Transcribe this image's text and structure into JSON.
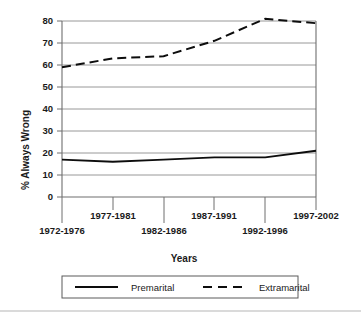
{
  "chart_data": {
    "type": "line",
    "title": "",
    "xlabel": "Years",
    "ylabel": "% Always Wrong",
    "categories": [
      "1972-1976",
      "1977-1981",
      "1982-1986",
      "1987-1991",
      "1992-1996",
      "1997-2002"
    ],
    "series": [
      {
        "name": "Premarital",
        "style": "solid",
        "values": [
          17,
          16,
          17,
          18,
          18,
          21
        ]
      },
      {
        "name": "Extramarital",
        "style": "dashed",
        "values": [
          59,
          63,
          64,
          71,
          81,
          79
        ]
      }
    ],
    "ylim": [
      0,
      80
    ],
    "ytick_labels": [
      "0",
      "10",
      "20",
      "30",
      "40",
      "50",
      "60",
      "70",
      "80"
    ],
    "ytick_values": [
      0,
      10,
      20,
      30,
      40,
      50,
      60,
      70,
      80
    ],
    "grid": true,
    "grid_axis": "y",
    "legend_position": "bottom",
    "legend_entries": [
      "Premarital",
      "Extramarital"
    ],
    "line_color": "#0d0d0d",
    "grid_color": "#8c8c8c",
    "background": "#ffffff"
  },
  "axes": {
    "y_title": "% Always Wrong",
    "x_title": "Years"
  },
  "ticks": {
    "y": [
      "80",
      "70",
      "60",
      "50",
      "40",
      "30",
      "20",
      "10",
      "0"
    ],
    "x_row_top": [
      "1977-1981",
      "1987-1991",
      "1997-2002"
    ],
    "x_row_bottom": [
      "1972-1976",
      "1982-1986",
      "1992-1996"
    ]
  },
  "legend": {
    "premarital_label": "Premarital",
    "extramarital_label": "Extramarital"
  }
}
